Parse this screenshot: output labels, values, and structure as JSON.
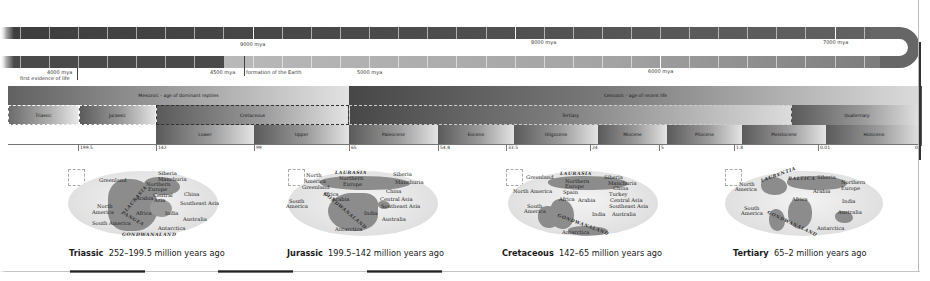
{
  "timeline": {
    "labels": {
      "mya_9000": "9000 mya",
      "mya_8000": "8000 mya",
      "mya_7000": "7000 mya",
      "mya_6000": "6000 mya",
      "mya_5000": "5000 mya",
      "mya_4500": "4500 mya",
      "mya_4000": "4000 mya",
      "first_life": "first evidence of life",
      "earth_formation": "formation of the Earth"
    }
  },
  "geologic_chart": {
    "eras": [
      {
        "label": "Mesozoic - age of dominant reptiles"
      },
      {
        "label": "Cenozoic - age of recent life"
      }
    ],
    "periods": [
      {
        "label": "Triassic"
      },
      {
        "label": "Jurassic"
      },
      {
        "label": "Cretaceous"
      },
      {
        "label": "Tertiary"
      },
      {
        "label": "Quaternary"
      }
    ],
    "epochs": [
      {
        "label": "Lower"
      },
      {
        "label": "Upper"
      },
      {
        "label": "Paleocene"
      },
      {
        "label": "Eocene"
      },
      {
        "label": "Oligocene"
      },
      {
        "label": "Miocene"
      },
      {
        "label": "Pliocene"
      },
      {
        "label": "Pleistocene"
      },
      {
        "label": "Holocene"
      }
    ],
    "ticks": [
      "199.5",
      "142",
      "99",
      "65",
      "54.8",
      "33.5",
      "24",
      "5",
      "1.8",
      "0.01",
      "0"
    ]
  },
  "maps": [
    {
      "period": "Triassic",
      "range": "252–199.5 million years ago",
      "labels": [
        "Greenland",
        "Siberia",
        "Manchuria",
        "Northern",
        "Europe",
        "China",
        "Central",
        "Asia",
        "Arabia",
        "Southeast Asia",
        "North",
        "America",
        "Africa",
        "India",
        "Australia",
        "South America",
        "Antarctica",
        "LAURASIA",
        "PANGEA",
        "GONDWANALAND"
      ]
    },
    {
      "period": "Jurassic",
      "range": "199.5–142 million years ago",
      "labels": [
        "North",
        "America",
        "LAURASIA",
        "Siberia",
        "Northern",
        "Europe",
        "Manchuria",
        "Greenland",
        "China",
        "Africa",
        "South",
        "America",
        "Arabia",
        "Central Asia",
        "Southeast Asia",
        "India",
        "Australia",
        "GONDWANALAND",
        "Antarctica"
      ]
    },
    {
      "period": "Cretaceous",
      "range": "142–65 million years ago",
      "labels": [
        "Greenland",
        "LAURASIA",
        "Siberia",
        "Northern",
        "Europe",
        "Manchuria",
        "North America",
        "China",
        "Spain",
        "Turkey",
        "Africa",
        "Arabia",
        "Central Asia",
        "South",
        "America",
        "Southeast Asia",
        "India",
        "Australia",
        "GONDWANALAND",
        "Antarctica"
      ]
    },
    {
      "period": "Tertiary",
      "range": "65–2 million years ago",
      "labels": [
        "LAURENTIA",
        "BALTICA",
        "Siberia",
        "North",
        "America",
        "Northern",
        "Europe",
        "Arabia",
        "Africa",
        "India",
        "South",
        "America",
        "Australia",
        "GONDWANALAND",
        "Antarctica"
      ]
    }
  ],
  "colors": {
    "band_dark": "#4a4a4a",
    "band_light": "#b0b0b0",
    "land": "#8c8c8c",
    "ocean": "#e4e4e4"
  }
}
